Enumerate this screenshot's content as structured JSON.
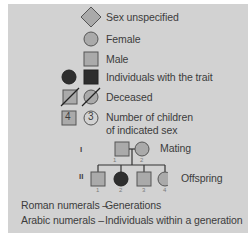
{
  "legend": {
    "items": [
      {
        "symbol": "diamond-icon",
        "label": "Sex unspecified"
      },
      {
        "symbol": "circle-icon",
        "label": "Female"
      },
      {
        "symbol": "square-icon",
        "label": "Male"
      },
      {
        "symbol": "filled-circle-square-icon",
        "label": "Individuals with the trait"
      },
      {
        "symbol": "deceased-slash-icon",
        "label": "Deceased"
      },
      {
        "symbol": "numbered-square-circle-icon",
        "label_line1": "Number of children",
        "label_line2": "of indicated sex",
        "square_number": "4",
        "circle_number": "3"
      }
    ]
  },
  "pedigree": {
    "generation_I": "I",
    "generation_II": "II",
    "mating_label": "Mating",
    "offspring_label": "Offspring",
    "parents": [
      {
        "sex": "male",
        "number": "1",
        "affected": false
      },
      {
        "sex": "female",
        "number": "2",
        "affected": false
      }
    ],
    "children": [
      {
        "sex": "male",
        "number": "1",
        "affected": false
      },
      {
        "sex": "female",
        "number": "2",
        "affected": true
      },
      {
        "sex": "male",
        "number": "3",
        "affected": false
      },
      {
        "sex": "female",
        "number": "4",
        "affected": false
      }
    ]
  },
  "notes": {
    "roman_key": "Roman numerals –",
    "roman_value": "Generations",
    "arabic_key": "Arabic numerals –",
    "arabic_value": "Individuals within a generation"
  },
  "colors": {
    "panel": "#d2d2d2",
    "symbol_fill": "#aaaaaa",
    "affected_fill": "#2e2e2e",
    "stroke": "#555555"
  }
}
